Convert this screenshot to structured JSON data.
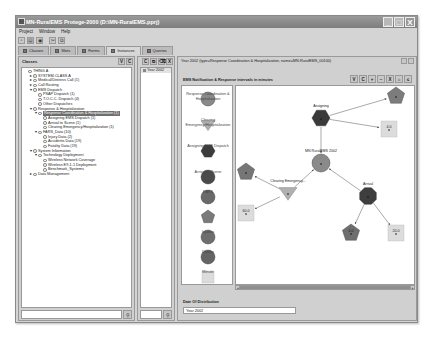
{
  "window": {
    "title": "MN-RuralEMS  Protege-2000   (D:\\MN-RuralEMS.pprj)",
    "controls": [
      "_",
      "□",
      "X"
    ]
  },
  "menu": [
    "Project",
    "Window",
    "Help"
  ],
  "toolbar": [
    {
      "icon": "new-project-icon",
      "glyph": "▫"
    },
    {
      "icon": "open-project-icon",
      "glyph": "▤"
    },
    {
      "icon": "save-project-icon",
      "glyph": "◉"
    },
    {
      "icon": "cut-icon",
      "glyph": "✂"
    },
    {
      "icon": "copy-icon",
      "glyph": "⧉"
    }
  ],
  "tabs": [
    {
      "label": "Classes",
      "active": false
    },
    {
      "label": "Slots",
      "active": false
    },
    {
      "label": "Forms",
      "active": false
    },
    {
      "label": "Instances",
      "active": true
    },
    {
      "label": "Queries",
      "active": false
    }
  ],
  "classes_panel": {
    "title": "Classes",
    "header_buttons": [
      "V",
      "C"
    ],
    "tree": [
      {
        "label": "THING",
        "sup": "A",
        "depth": 0,
        "exp": "",
        "sel": false
      },
      {
        "label": "SYSTEM-CLASS",
        "sup": "A",
        "depth": 1,
        "exp": "►",
        "sel": false
      },
      {
        "label": "Medical/Distress Call  (1)",
        "depth": 1,
        "exp": "►",
        "sel": false
      },
      {
        "label": "Call Routing",
        "depth": 1,
        "exp": "►",
        "sel": false
      },
      {
        "label": "EMS Dispatch",
        "depth": 1,
        "exp": "▼",
        "sel": false
      },
      {
        "label": "PSAP Dispatch  (1)",
        "depth": 2,
        "exp": "",
        "sel": false
      },
      {
        "label": "T.O.C.C. Dispatch  (4)",
        "depth": 2,
        "exp": "",
        "sel": false
      },
      {
        "label": "Other Dispatches",
        "depth": 2,
        "exp": "",
        "sel": false
      },
      {
        "label": "Response & Hospitalization",
        "depth": 1,
        "exp": "▼",
        "sel": false
      },
      {
        "label": "Response Coordination & Hospitalization  (1)",
        "depth": 2,
        "exp": "▼",
        "sel": true
      },
      {
        "label": "Assigning EMS Dispatch  (1)",
        "depth": 3,
        "exp": "",
        "sel": false
      },
      {
        "label": "Arrival to Scene  (1)",
        "depth": 3,
        "exp": "",
        "sel": false
      },
      {
        "label": "Clearing Emergency/Hospitalization  (1)",
        "depth": 3,
        "exp": "",
        "sel": false
      },
      {
        "label": "FARS_Data  (10)",
        "depth": 2,
        "exp": "▼",
        "sel": false
      },
      {
        "label": "Injury Data  (2)",
        "depth": 3,
        "exp": "",
        "sel": false
      },
      {
        "label": "Accidents Data  (19)",
        "depth": 3,
        "exp": "",
        "sel": false
      },
      {
        "label": "Fatality Data  (19)",
        "depth": 3,
        "exp": "",
        "sel": false
      },
      {
        "label": "System Information",
        "depth": 1,
        "exp": "▼",
        "sel": false
      },
      {
        "label": "Technology Deployment",
        "depth": 2,
        "exp": "▼",
        "sel": false
      },
      {
        "label": "Wireless Network Coverage",
        "depth": 3,
        "exp": "",
        "sel": false
      },
      {
        "label": "Wireless E9-1-1 Deployment",
        "depth": 3,
        "exp": "",
        "sel": false
      },
      {
        "label": "Benchmark_Systems",
        "depth": 3,
        "exp": "",
        "sel": false
      },
      {
        "label": "Data Management",
        "depth": 1,
        "exp": "►",
        "sel": false
      }
    ],
    "find_button": "binoculars-icon"
  },
  "instances_panel": {
    "header_buttons": [
      "C",
      "⧉",
      "⌫",
      "X"
    ],
    "items": [
      "Year 2002"
    ],
    "find_button": "binoculars-icon"
  },
  "form_panel": {
    "header": "Year 2002   (type=Response Coordination & Hospitalization, name=MN-RuralEMS_00100)",
    "graph_title": "EMS Notification & Response intervals in minutes",
    "graph_tools": [
      "V",
      "C",
      "+",
      "−",
      "X",
      "⌂",
      "≤"
    ],
    "palette": [
      {
        "label": "Response Coordination & Hospitalization",
        "shape": "circle",
        "color": "#8a8a8a"
      },
      {
        "label": "Clearing Emergency/Hospitalization",
        "shape": "triangle-down",
        "color": "#b0b0b0"
      },
      {
        "label": "Assigning EMS Dispatch",
        "shape": "hexagon",
        "color": "#3c3c3c"
      },
      {
        "label": "Arrival to Scene",
        "shape": "circle",
        "color": "#4a4a4a"
      },
      {
        "label": "FARS",
        "shape": "circle",
        "color": "#6a6a6a"
      },
      {
        "label": "",
        "shape": "pentagon",
        "color": "#7a7a7a"
      },
      {
        "label": "Injuries",
        "shape": "circle",
        "color": "#6e6e6e"
      },
      {
        "label": "Deaths",
        "shape": "circle",
        "color": "#646464"
      },
      {
        "label": "Minute",
        "shape": "square",
        "color": "#dcdcdc"
      }
    ],
    "nodes": [
      {
        "id": "assigning",
        "label": "Assigning",
        "shape": "hexagon",
        "x": 85,
        "y": 32,
        "color": "#3a3a3a"
      },
      {
        "id": "pent-top",
        "label": "",
        "shape": "pentagon",
        "x": 160,
        "y": 10,
        "color": "#7c7c7c"
      },
      {
        "id": "min-4",
        "label": "4.0",
        "shape": "square",
        "x": 153,
        "y": 43,
        "color": "#dcdcdc"
      },
      {
        "id": "rch",
        "label": "MN RuralEMS 2002",
        "shape": "circle",
        "x": 85,
        "y": 77,
        "color": "#8a8a8a"
      },
      {
        "id": "pent-left",
        "label": "",
        "shape": "pentagon",
        "x": 10,
        "y": 86,
        "color": "#767676"
      },
      {
        "id": "clearing",
        "label": "Clearing Emergency...",
        "shape": "triangle-down",
        "x": 52,
        "y": 107,
        "color": "#b0b0b0"
      },
      {
        "id": "min-60",
        "label": "60.0",
        "shape": "square",
        "x": 10,
        "y": 127,
        "color": "#dcdcdc"
      },
      {
        "id": "arrival",
        "label": "Arrival",
        "shape": "octagon",
        "x": 132,
        "y": 110,
        "color": "#3e3e3e"
      },
      {
        "id": "pent-bottom",
        "label": "4.0",
        "shape": "pentagon",
        "x": 115,
        "y": 147,
        "color": "#6e6e6e"
      },
      {
        "id": "min-20",
        "label": "20.0",
        "shape": "square",
        "x": 160,
        "y": 147,
        "color": "#dcdcdc"
      }
    ],
    "date_label": "Date Of Distribution",
    "date_value": "Year 2002"
  }
}
